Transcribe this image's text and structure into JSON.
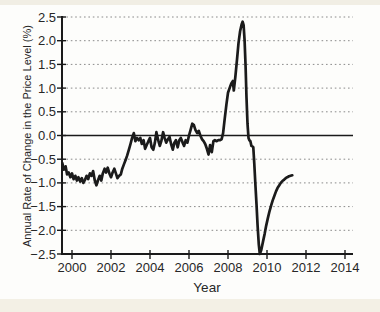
{
  "page": {
    "background_color": "#fdfdfb",
    "paper_edge_color": "#f2efe5"
  },
  "chart_data": {
    "type": "line",
    "title": "",
    "xlabel": "Year",
    "ylabel": "Annual Rate of Change in the Price Level (%)",
    "xlim": [
      1999.5,
      2014.4
    ],
    "ylim": [
      -2.5,
      2.5
    ],
    "grid": "horizontal-dotted",
    "zero_line": true,
    "legend": "none",
    "line_color": "#1b1b1b",
    "axis_color": "#1a1a1a",
    "grid_color": "#8a8a8a",
    "x_ticks": [
      {
        "label": "2000",
        "value": 2000
      },
      {
        "label": "2002",
        "value": 2002
      },
      {
        "label": "2004",
        "value": 2004
      },
      {
        "label": "2006",
        "value": 2006
      },
      {
        "label": "2008",
        "value": 2008
      },
      {
        "label": "2010",
        "value": 2010
      },
      {
        "label": "2012",
        "value": 2012
      },
      {
        "label": "2014",
        "value": 2014
      }
    ],
    "y_ticks": [
      {
        "label": "2.5",
        "value": 2.5
      },
      {
        "label": "2.0",
        "value": 2.0
      },
      {
        "label": "1.5",
        "value": 1.5
      },
      {
        "label": "1.0",
        "value": 1.0
      },
      {
        "label": "0.5",
        "value": 0.5
      },
      {
        "label": "0.0",
        "value": 0.0
      },
      {
        "label": "−0.5",
        "value": -0.5
      },
      {
        "label": "−1.0",
        "value": -1.0
      },
      {
        "label": "−1.5",
        "value": -1.5
      },
      {
        "label": "−2.0",
        "value": -2.0
      },
      {
        "label": "−2.5",
        "value": -2.5
      }
    ],
    "series": [
      {
        "name": "annual-rate-of-change-in-price-level",
        "points": [
          [
            1999.5,
            -0.58
          ],
          [
            1999.58,
            -0.72
          ],
          [
            1999.67,
            -0.65
          ],
          [
            1999.75,
            -0.82
          ],
          [
            1999.83,
            -0.78
          ],
          [
            1999.92,
            -0.88
          ],
          [
            2000.0,
            -0.8
          ],
          [
            2000.08,
            -0.92
          ],
          [
            2000.17,
            -0.85
          ],
          [
            2000.25,
            -0.95
          ],
          [
            2000.33,
            -0.88
          ],
          [
            2000.42,
            -0.97
          ],
          [
            2000.5,
            -0.9
          ],
          [
            2000.58,
            -1.0
          ],
          [
            2000.67,
            -0.93
          ],
          [
            2000.75,
            -0.85
          ],
          [
            2000.83,
            -0.92
          ],
          [
            2000.92,
            -0.8
          ],
          [
            2001.0,
            -0.85
          ],
          [
            2001.08,
            -0.75
          ],
          [
            2001.17,
            -0.95
          ],
          [
            2001.25,
            -1.05
          ],
          [
            2001.33,
            -0.95
          ],
          [
            2001.42,
            -0.85
          ],
          [
            2001.5,
            -0.95
          ],
          [
            2001.58,
            -0.8
          ],
          [
            2001.67,
            -0.7
          ],
          [
            2001.75,
            -0.78
          ],
          [
            2001.83,
            -0.68
          ],
          [
            2001.92,
            -0.8
          ],
          [
            2002.0,
            -0.88
          ],
          [
            2002.08,
            -0.78
          ],
          [
            2002.17,
            -0.7
          ],
          [
            2002.25,
            -0.8
          ],
          [
            2002.33,
            -0.9
          ],
          [
            2002.42,
            -0.85
          ],
          [
            2002.5,
            -0.82
          ],
          [
            2002.58,
            -0.7
          ],
          [
            2002.67,
            -0.6
          ],
          [
            2002.75,
            -0.52
          ],
          [
            2002.83,
            -0.42
          ],
          [
            2002.92,
            -0.3
          ],
          [
            2003.0,
            -0.18
          ],
          [
            2003.08,
            -0.05
          ],
          [
            2003.17,
            0.05
          ],
          [
            2003.25,
            -0.12
          ],
          [
            2003.33,
            -0.05
          ],
          [
            2003.42,
            -0.1
          ],
          [
            2003.5,
            -0.05
          ],
          [
            2003.58,
            -0.18
          ],
          [
            2003.67,
            -0.1
          ],
          [
            2003.75,
            -0.28
          ],
          [
            2003.83,
            -0.2
          ],
          [
            2003.92,
            -0.12
          ],
          [
            2004.0,
            -0.05
          ],
          [
            2004.08,
            -0.25
          ],
          [
            2004.17,
            -0.3
          ],
          [
            2004.25,
            -0.15
          ],
          [
            2004.33,
            0.07
          ],
          [
            2004.42,
            -0.1
          ],
          [
            2004.5,
            -0.22
          ],
          [
            2004.58,
            -0.12
          ],
          [
            2004.67,
            0.07
          ],
          [
            2004.75,
            -0.05
          ],
          [
            2004.83,
            -0.15
          ],
          [
            2004.92,
            -0.08
          ],
          [
            2005.0,
            -0.03
          ],
          [
            2005.08,
            -0.18
          ],
          [
            2005.17,
            -0.3
          ],
          [
            2005.25,
            -0.15
          ],
          [
            2005.33,
            -0.1
          ],
          [
            2005.42,
            -0.25
          ],
          [
            2005.5,
            -0.1
          ],
          [
            2005.58,
            -0.05
          ],
          [
            2005.67,
            -0.15
          ],
          [
            2005.75,
            -0.22
          ],
          [
            2005.83,
            -0.1
          ],
          [
            2005.92,
            -0.15
          ],
          [
            2006.0,
            0.0
          ],
          [
            2006.08,
            0.12
          ],
          [
            2006.17,
            0.25
          ],
          [
            2006.25,
            0.22
          ],
          [
            2006.33,
            0.12
          ],
          [
            2006.42,
            0.05
          ],
          [
            2006.5,
            0.1
          ],
          [
            2006.58,
            0.0
          ],
          [
            2006.67,
            -0.08
          ],
          [
            2006.75,
            -0.12
          ],
          [
            2006.83,
            -0.18
          ],
          [
            2006.92,
            -0.28
          ],
          [
            2007.0,
            -0.4
          ],
          [
            2007.08,
            -0.2
          ],
          [
            2007.17,
            -0.35
          ],
          [
            2007.25,
            -0.12
          ],
          [
            2007.33,
            -0.1
          ],
          [
            2007.42,
            -0.12
          ],
          [
            2007.5,
            -0.1
          ],
          [
            2007.58,
            -0.1
          ],
          [
            2007.67,
            -0.08
          ],
          [
            2007.75,
            0.05
          ],
          [
            2007.83,
            0.35
          ],
          [
            2007.92,
            0.65
          ],
          [
            2008.0,
            0.9
          ],
          [
            2008.08,
            1.0
          ],
          [
            2008.17,
            1.1
          ],
          [
            2008.25,
            1.15
          ],
          [
            2008.3,
            0.95
          ],
          [
            2008.38,
            1.25
          ],
          [
            2008.46,
            1.6
          ],
          [
            2008.54,
            1.95
          ],
          [
            2008.62,
            2.2
          ],
          [
            2008.7,
            2.35
          ],
          [
            2008.75,
            2.4
          ],
          [
            2008.8,
            2.33
          ],
          [
            2008.85,
            2.0
          ],
          [
            2008.9,
            1.45
          ],
          [
            2008.95,
            0.8
          ],
          [
            2009.0,
            0.25
          ],
          [
            2009.05,
            -0.05
          ],
          [
            2009.1,
            -0.1
          ],
          [
            2009.15,
            -0.12
          ],
          [
            2009.2,
            -0.22
          ],
          [
            2009.25,
            -0.23
          ],
          [
            2009.3,
            -0.25
          ],
          [
            2009.35,
            -0.6
          ],
          [
            2009.4,
            -1.0
          ],
          [
            2009.46,
            -1.45
          ],
          [
            2009.52,
            -1.9
          ],
          [
            2009.58,
            -2.3
          ],
          [
            2009.63,
            -2.5
          ],
          [
            2009.7,
            -2.42
          ],
          [
            2009.79,
            -2.25
          ],
          [
            2009.88,
            -2.07
          ],
          [
            2009.96,
            -1.9
          ],
          [
            2010.04,
            -1.75
          ],
          [
            2010.13,
            -1.6
          ],
          [
            2010.21,
            -1.48
          ],
          [
            2010.29,
            -1.37
          ],
          [
            2010.38,
            -1.27
          ],
          [
            2010.46,
            -1.18
          ],
          [
            2010.54,
            -1.11
          ],
          [
            2010.63,
            -1.05
          ],
          [
            2010.71,
            -1.0
          ],
          [
            2010.79,
            -0.96
          ],
          [
            2010.88,
            -0.93
          ],
          [
            2010.96,
            -0.9
          ],
          [
            2011.04,
            -0.88
          ],
          [
            2011.13,
            -0.86
          ],
          [
            2011.21,
            -0.85
          ],
          [
            2011.3,
            -0.84
          ]
        ]
      }
    ]
  }
}
